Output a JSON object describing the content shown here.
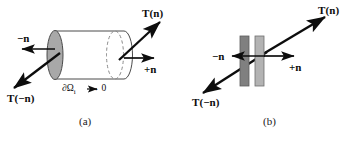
{
  "figure": {
    "width": 362,
    "height": 142,
    "background": "#ffffff",
    "ink_color": "#0d0d0d",
    "panels": [
      {
        "id": "a",
        "caption": "(a)",
        "shape": "cylinder-pillbox",
        "shape_fill_cap": "#a8a8a8",
        "shape_fill_body": "#ffffff",
        "labels": {
          "minus_n": "−n",
          "plus_n": "+n",
          "traction_n": "T(n)",
          "traction_minus_n": "T(−n)",
          "domain": "∂Ω",
          "domain_sub": "i",
          "domain_limit": "→ 0"
        }
      },
      {
        "id": "b",
        "caption": "(b)",
        "shape": "two-slabs",
        "slab_left_fill": "#808080",
        "slab_right_fill": "#b3b3b3",
        "labels": {
          "minus_n": "−n",
          "plus_n": "+n",
          "traction_n": "T(n)",
          "traction_minus_n": "T(−n)"
        }
      }
    ]
  }
}
